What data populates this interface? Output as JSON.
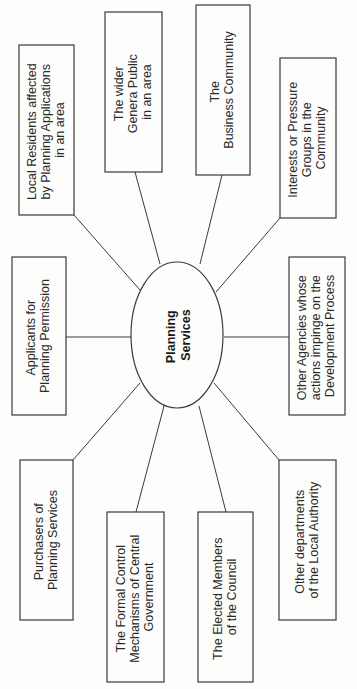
{
  "diagram": {
    "center": {
      "lines": [
        "Planning",
        "Services"
      ]
    },
    "nodes": [
      {
        "id": "local-residents",
        "lines": [
          "Local Residents affected",
          "by Planning Applications",
          "in an area"
        ]
      },
      {
        "id": "wider-public",
        "lines": [
          "The wider",
          "Genera Public",
          "in an area"
        ]
      },
      {
        "id": "business-community",
        "lines": [
          "The",
          "Business Community"
        ]
      },
      {
        "id": "interest-groups",
        "lines": [
          "Interests or Pressure",
          "Groups in the",
          "Community"
        ]
      },
      {
        "id": "applicants",
        "lines": [
          "Applicants for",
          "Planning Permission"
        ]
      },
      {
        "id": "other-agencies",
        "lines": [
          "Other Agencies whose",
          "actions impinge on the",
          "Development Process"
        ]
      },
      {
        "id": "purchasers",
        "lines": [
          "Purchasers of",
          "Planning Services"
        ]
      },
      {
        "id": "central-government",
        "lines": [
          "The Formal Control",
          "Mechanisms of Central",
          "Government"
        ]
      },
      {
        "id": "elected-members",
        "lines": [
          "The Elected Members",
          "of the Council"
        ]
      },
      {
        "id": "other-departments",
        "lines": [
          "Other departments",
          "of the Local Authority"
        ]
      }
    ]
  }
}
